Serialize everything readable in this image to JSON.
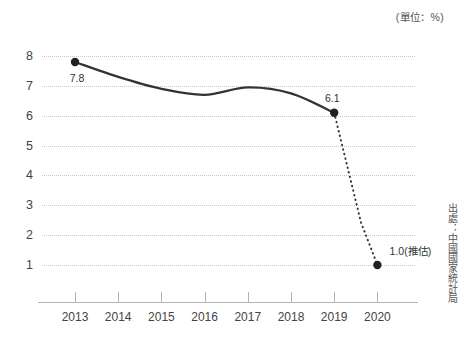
{
  "chart_data": {
    "type": "line",
    "title": "",
    "unit_caption": "(單位：%)",
    "source_note": "出處：中國國家統計局",
    "xlabel": "",
    "ylabel": "",
    "categories": [
      "2013",
      "2014",
      "2015",
      "2016",
      "2017",
      "2018",
      "2019",
      "2020"
    ],
    "ylim": [
      0,
      8
    ],
    "y_ticks": [
      "8",
      "7",
      "6",
      "5",
      "4",
      "3",
      "2",
      "1"
    ],
    "y_tick_values": [
      8,
      7,
      6,
      5,
      4,
      3,
      2,
      1
    ],
    "grid": true,
    "legend": "none",
    "series": [
      {
        "name": "中國GDP成長率",
        "values": [
          7.8,
          7.3,
          6.9,
          6.7,
          6.95,
          6.75,
          6.1,
          1.0
        ],
        "style": "solid-to-dotted",
        "solid_through_index": 6,
        "projected_index": 7
      }
    ],
    "markers": [
      {
        "category": "2013",
        "value": 7.8
      },
      {
        "category": "2019",
        "value": 6.1
      },
      {
        "category": "2020",
        "value": 1.0
      }
    ],
    "data_labels": [
      {
        "text": "7.8",
        "category": "2013",
        "value": 7.8
      },
      {
        "text": "6.1",
        "category": "2019",
        "value": 6.1
      },
      {
        "text": "1.0(推估)",
        "category": "2020",
        "value": 1.0
      }
    ],
    "colors": {
      "line": "#333333",
      "marker": "#222222",
      "gridline": "#c9c9c9",
      "axis": "#b4b4b4",
      "text": "#3a3a3a",
      "background": "#ffffff"
    }
  }
}
